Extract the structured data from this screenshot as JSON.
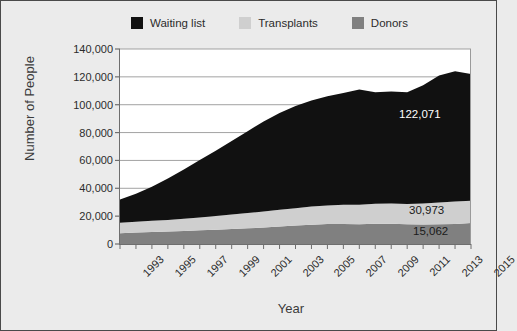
{
  "legend": {
    "position": "top",
    "items": [
      {
        "label": "Waiting list",
        "color": "#111111",
        "icon": "square-swatch-icon"
      },
      {
        "label": "Transplants",
        "color": "#cfcfcf",
        "icon": "square-swatch-icon"
      },
      {
        "label": "Donors",
        "color": "#808080",
        "icon": "square-swatch-icon"
      }
    ]
  },
  "axes": {
    "y_title": "Number of People",
    "x_title": "Year",
    "y_ticks": [
      "0",
      "20,000",
      "40,000",
      "60,000",
      "80,000",
      "100,000",
      "120,000",
      "140,000"
    ],
    "x_ticks": [
      "1993",
      "1995",
      "1997",
      "1999",
      "2001",
      "2003",
      "2005",
      "2007",
      "2009",
      "2011",
      "2013",
      "2015"
    ]
  },
  "annotations": [
    {
      "name": "waiting-list-value",
      "text": "122,071"
    },
    {
      "name": "transplants-value",
      "text": "30,973"
    },
    {
      "name": "donors-value",
      "text": "15,062"
    }
  ],
  "chart_data": {
    "type": "area",
    "stacked": true,
    "title": "",
    "subtitle": "",
    "xlabel": "Year",
    "ylabel": "Number of People",
    "ylim": [
      0,
      140000
    ],
    "ytick_step": 20000,
    "grid": true,
    "grid_axis": "y",
    "legend_position": "top",
    "x": [
      1993,
      1994,
      1995,
      1996,
      1997,
      1998,
      1999,
      2000,
      2001,
      2002,
      2003,
      2004,
      2005,
      2006,
      2007,
      2008,
      2009,
      2010,
      2011,
      2012,
      2013,
      2014,
      2015
    ],
    "xlim": [
      1993,
      2015
    ],
    "series": [
      {
        "name": "Donors",
        "color": "#808080",
        "stack_order": 1,
        "values": [
          7800,
          8200,
          8600,
          8900,
          9300,
          9800,
          10300,
          10800,
          11300,
          11800,
          12600,
          13200,
          13900,
          14300,
          14400,
          14200,
          14600,
          14500,
          14100,
          14000,
          14250,
          14400,
          15062
        ]
      },
      {
        "name": "Transplants",
        "color": "#cfcfcf",
        "stack_order": 2,
        "values": [
          7500,
          7800,
          8100,
          8400,
          8800,
          9300,
          9800,
          10400,
          10900,
          11500,
          12000,
          12500,
          13000,
          13400,
          13800,
          14000,
          14300,
          14500,
          14700,
          15100,
          15600,
          16100,
          15911
        ]
      },
      {
        "name": "Waiting list",
        "color": "#111111",
        "stack_order": 3,
        "values": [
          16700,
          20000,
          24400,
          29700,
          35400,
          41200,
          46900,
          52800,
          58800,
          64700,
          69400,
          73300,
          76100,
          78300,
          80200,
          82800,
          80100,
          80500,
          80200,
          84900,
          91150,
          93500,
          91098
        ]
      }
    ],
    "cumulative_totals": {
      "Donors": [
        7800,
        8200,
        8600,
        8900,
        9300,
        9800,
        10300,
        10800,
        11300,
        11800,
        12600,
        13200,
        13900,
        14300,
        14400,
        14200,
        14600,
        14500,
        14100,
        14000,
        14250,
        14400,
        15062
      ],
      "Donors+Transplants": [
        15300,
        16000,
        16700,
        17300,
        18100,
        19100,
        20100,
        21200,
        22200,
        23300,
        24600,
        25700,
        26900,
        27700,
        28200,
        28200,
        28900,
        29000,
        28800,
        29100,
        29850,
        30500,
        30973
      ],
      "Total": [
        32000,
        36000,
        41100,
        47000,
        53500,
        60300,
        67000,
        74000,
        81000,
        88000,
        94000,
        99000,
        103000,
        106000,
        108400,
        111000,
        109000,
        109500,
        109000,
        114000,
        121000,
        124000,
        122071
      ]
    },
    "labeled_points": [
      {
        "series": "Waiting list",
        "x": 2015,
        "label": "122,071"
      },
      {
        "series": "Transplants",
        "x": 2015,
        "label": "30,973"
      },
      {
        "series": "Donors",
        "x": 2015,
        "label": "15,062"
      }
    ]
  }
}
